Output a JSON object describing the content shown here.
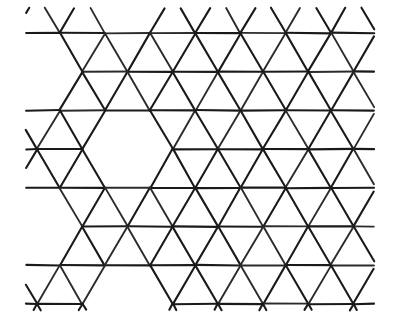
{
  "figure": {
    "kind": "geometric-tessellation",
    "background_color": "#ffffff",
    "line_color": "#1a1a1a",
    "line_width_px": 2.1,
    "canvas": {
      "width": 400,
      "height": 318
    },
    "style_note": "hand-drawn photocopied line art"
  },
  "chart_data": {
    "type": "diagram",
    "lattice": {
      "row_spacing_px": 38.7,
      "column_spacing_px": 45.2,
      "row_offset_px": 22.6,
      "row_y": [
        33,
        72,
        111,
        150,
        189,
        228,
        267
      ],
      "origin_x_even": 14.5,
      "origin_x_odd": 37.1,
      "clip": {
        "x0": 26,
        "y0": 8,
        "x1": 374,
        "y1": 310
      }
    },
    "hexagon_holes": [
      {
        "center_x": 128,
        "center_y": 150,
        "label": "left-hexagon"
      },
      {
        "center_x": 218,
        "center_y": 111,
        "label": "upper-right-hexagon"
      },
      {
        "center_x": 218,
        "center_y": 189,
        "label": "lower-right-hexagon"
      },
      {
        "center_x": 38,
        "center_y": 72,
        "label": "far-left-upper-partial"
      },
      {
        "center_x": 38,
        "center_y": 228,
        "label": "far-left-lower-partial"
      },
      {
        "center_x": 308,
        "center_y": 33,
        "label": "top-right-partial"
      },
      {
        "center_x": 308,
        "center_y": 267,
        "label": "bottom-right-partial"
      },
      {
        "center_x": 128,
        "center_y": 306,
        "label": "bottom-left-partial"
      },
      {
        "center_x": 128,
        "center_y": -6,
        "label": "top-left-partial"
      }
    ],
    "xlabel": "",
    "ylabel": "",
    "legend": []
  }
}
